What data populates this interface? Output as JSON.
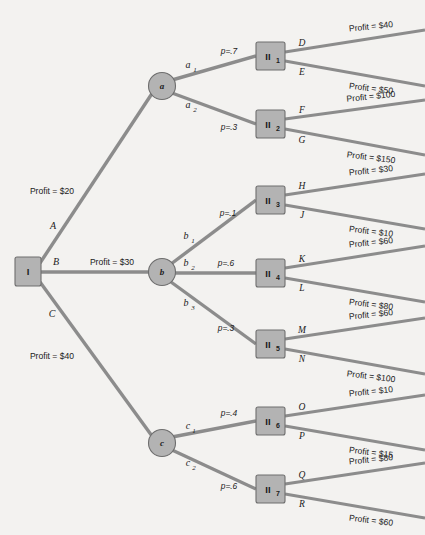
{
  "diagram": {
    "type": "decision-tree",
    "colors": {
      "node_fill": "#b3b3b3",
      "node_stroke": "#6e6e6e",
      "edge": "#8c8c8c",
      "background": "#f3f2f0",
      "text": "#1b1b1b"
    },
    "root": {
      "label": "I"
    },
    "decision_nodes": [
      {
        "id": "a",
        "label": "a"
      },
      {
        "id": "b",
        "label": "b"
      },
      {
        "id": "c",
        "label": "c"
      }
    ],
    "chance_nodes": [
      {
        "id": "II1",
        "label": "II",
        "sub": "1"
      },
      {
        "id": "II2",
        "label": "II",
        "sub": "2"
      },
      {
        "id": "II3",
        "label": "II",
        "sub": "3"
      },
      {
        "id": "II4",
        "label": "II",
        "sub": "4"
      },
      {
        "id": "II5",
        "label": "II",
        "sub": "5"
      },
      {
        "id": "II6",
        "label": "II",
        "sub": "6"
      },
      {
        "id": "II7",
        "label": "II",
        "sub": "7"
      }
    ],
    "root_branches": [
      {
        "id": "A",
        "label": "A",
        "payoff": "Profit = $20",
        "to": "a"
      },
      {
        "id": "B",
        "label": "B",
        "payoff": "Profit = $30",
        "to": "b"
      },
      {
        "id": "C",
        "label": "C",
        "payoff": "Profit = $40",
        "to": "c"
      }
    ],
    "second_branches": [
      {
        "label": "a",
        "sub": "1",
        "prob": "p=.7",
        "from": "a",
        "to": "II1"
      },
      {
        "label": "a",
        "sub": "2",
        "prob": "p=.3",
        "from": "a",
        "to": "II2"
      },
      {
        "label": "b",
        "sub": "1",
        "prob": "p=.1",
        "from": "b",
        "to": "II3"
      },
      {
        "label": "b",
        "sub": "2",
        "prob": "p=.6",
        "from": "b",
        "to": "II4"
      },
      {
        "label": "b",
        "sub": "3",
        "prob": "p=.3",
        "from": "b",
        "to": "II5"
      },
      {
        "label": "c",
        "sub": "1",
        "prob": "p=.4",
        "from": "c",
        "to": "II6"
      },
      {
        "label": "c",
        "sub": "2",
        "prob": "p=.6",
        "from": "c",
        "to": "II7"
      }
    ],
    "outcomes": [
      {
        "label": "D",
        "payoff": "Profit = $40",
        "from": "II1"
      },
      {
        "label": "E",
        "payoff": "Profit = $50",
        "from": "II1"
      },
      {
        "label": "F",
        "payoff": "Profit = $100",
        "from": "II2"
      },
      {
        "label": "G",
        "payoff": "Profit = $150",
        "from": "II2"
      },
      {
        "label": "H",
        "payoff": "Profit = $30",
        "from": "II3"
      },
      {
        "label": "J",
        "payoff": "Profit = $10",
        "from": "II3"
      },
      {
        "label": "K",
        "payoff": "Profit = $60",
        "from": "II4"
      },
      {
        "label": "L",
        "payoff": "Profit = $80",
        "from": "II4"
      },
      {
        "label": "M",
        "payoff": "Profit = $60",
        "from": "II5"
      },
      {
        "label": "N",
        "payoff": "Profit = $100",
        "from": "II5"
      },
      {
        "label": "O",
        "payoff": "Profit = $10",
        "from": "II6"
      },
      {
        "label": "P",
        "payoff": "Profit = $15",
        "from": "II6"
      },
      {
        "label": "Q",
        "payoff": "Profit = $80",
        "from": "II7"
      },
      {
        "label": "R",
        "payoff": "Profit = $60",
        "from": "II7"
      }
    ]
  }
}
